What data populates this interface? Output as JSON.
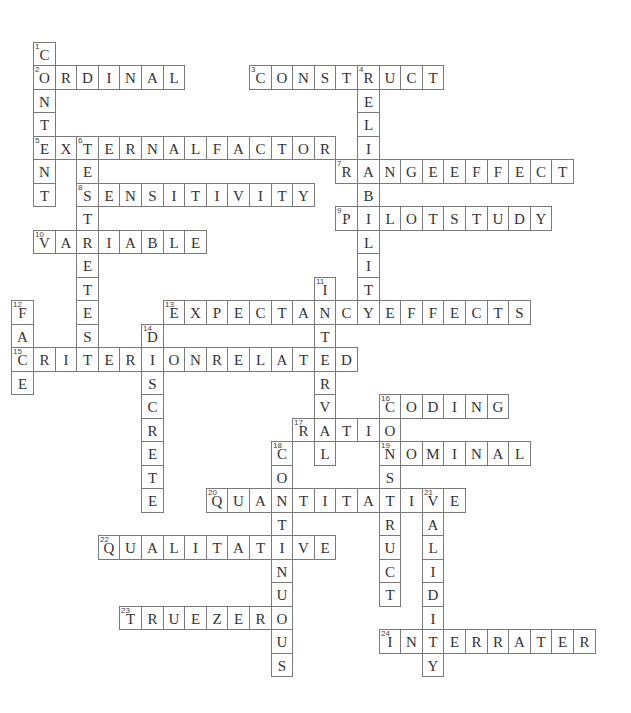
{
  "puzzle": {
    "grid": {
      "origin_x": 33,
      "origin_y": 41.5,
      "cell_w": 21.6,
      "cell_h": 23.5
    },
    "colors": {
      "border": "#7a7a7a",
      "text": "#333333",
      "background": "#ffffff"
    },
    "words": [
      {
        "number": 1,
        "direction": "down",
        "row": 0,
        "col": 0,
        "answer": "CONTENT"
      },
      {
        "number": 2,
        "direction": "across",
        "row": 1,
        "col": 0,
        "answer": "ORDINAL"
      },
      {
        "number": 3,
        "direction": "across",
        "row": 1,
        "col": 10,
        "answer": "CONSTRUCT"
      },
      {
        "number": 4,
        "direction": "down",
        "row": 1,
        "col": 15,
        "answer": "RELIABILITY"
      },
      {
        "number": 5,
        "direction": "across",
        "row": 4,
        "col": 0,
        "answer": "EXTERNALFACTOR"
      },
      {
        "number": 6,
        "direction": "down",
        "row": 4,
        "col": 2,
        "answer": "TESTRETEST"
      },
      {
        "number": 7,
        "direction": "across",
        "row": 5,
        "col": 14,
        "answer": "RANGEEFFECT"
      },
      {
        "number": 8,
        "direction": "across",
        "row": 6,
        "col": 2,
        "answer": "SENSITIVITY"
      },
      {
        "number": 9,
        "direction": "across",
        "row": 7,
        "col": 14,
        "answer": "PILOTSTUDY"
      },
      {
        "number": 10,
        "direction": "across",
        "row": 8,
        "col": 0,
        "answer": "VARIABLE"
      },
      {
        "number": 11,
        "direction": "down",
        "row": 10,
        "col": 13,
        "answer": "INTERVAL"
      },
      {
        "number": 12,
        "direction": "down",
        "row": 11,
        "col": -1,
        "answer": "FACE"
      },
      {
        "number": 13,
        "direction": "across",
        "row": 11,
        "col": 6,
        "answer": "EXPECTANCYEFFECTS"
      },
      {
        "number": 14,
        "direction": "down",
        "row": 12,
        "col": 5,
        "answer": "DISCRETE"
      },
      {
        "number": 15,
        "direction": "across",
        "row": 13,
        "col": -1,
        "answer": "CRITERIONRELATED"
      },
      {
        "number": 16,
        "direction": "across",
        "row": 15,
        "col": 16,
        "answer": "CODING"
      },
      {
        "number": 16,
        "direction": "down",
        "row": 15,
        "col": 16,
        "answer": "CONSTRUCT"
      },
      {
        "number": 17,
        "direction": "across",
        "row": 16,
        "col": 12,
        "answer": "RATIO"
      },
      {
        "number": 18,
        "direction": "down",
        "row": 17,
        "col": 11,
        "answer": "CONTINUOUS"
      },
      {
        "number": 19,
        "direction": "across",
        "row": 17,
        "col": 16,
        "answer": "NOMINAL"
      },
      {
        "number": 20,
        "direction": "across",
        "row": 19,
        "col": 8,
        "answer": "QUANTITATIVE"
      },
      {
        "number": 21,
        "direction": "down",
        "row": 19,
        "col": 18,
        "answer": "VALIDITY"
      },
      {
        "number": 22,
        "direction": "across",
        "row": 21,
        "col": 3,
        "answer": "QUALITATIVE"
      },
      {
        "number": 23,
        "direction": "across",
        "row": 24,
        "col": 4,
        "answer": "TRUEZERO"
      },
      {
        "number": 24,
        "direction": "across",
        "row": 25,
        "col": 16,
        "answer": "INTERRATER"
      }
    ]
  }
}
